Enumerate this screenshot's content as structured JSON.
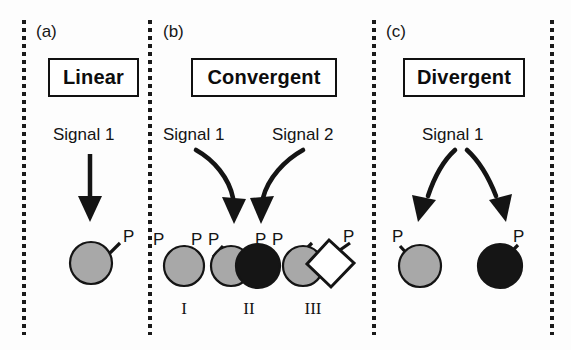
{
  "figure": {
    "background_color": "#fdfdfd",
    "ink_color": "#141414",
    "gray_fill": "#a8a8a8",
    "black_fill": "#151515",
    "white_fill": "#ffffff"
  },
  "panels": [
    {
      "letter": "(a)",
      "title": "Linear",
      "signals": [
        "Signal 1"
      ],
      "arrow_type": "straight",
      "groups": [],
      "molecules": [
        {
          "shape": "circle",
          "fill": "gray",
          "phosphates": [
            "P"
          ]
        }
      ]
    },
    {
      "letter": "(b)",
      "title": "Convergent",
      "signals": [
        "Signal 1",
        "Signal 2"
      ],
      "arrow_type": "curved-convergent",
      "groups": [
        "I",
        "II",
        "III"
      ],
      "molecules": [
        {
          "shape": "circle",
          "fill": "gray",
          "phosphates": [
            "P"
          ]
        },
        {
          "shape": "circle-pair",
          "fill": "gray+black",
          "phosphates": [
            "P",
            "P"
          ]
        },
        {
          "shape": "circle-diamond",
          "fill": "gray+white",
          "phosphates": [
            "P",
            "P",
            "P"
          ]
        }
      ]
    },
    {
      "letter": "(c)",
      "title": "Divergent",
      "signals": [
        "Signal 1"
      ],
      "arrow_type": "curved-divergent",
      "groups": [],
      "molecules": [
        {
          "shape": "circle",
          "fill": "gray",
          "phosphates": [
            "P"
          ]
        },
        {
          "shape": "circle",
          "fill": "black",
          "phosphates": [
            "P"
          ]
        }
      ]
    }
  ],
  "labels": {
    "panel_a_letter": "(a)",
    "panel_b_letter": "(b)",
    "panel_c_letter": "(c)",
    "title_a": "Linear",
    "title_b": "Convergent",
    "title_c": "Divergent",
    "signal_a1": "Signal 1",
    "signal_b1": "Signal 1",
    "signal_b2": "Signal 2",
    "signal_c1": "Signal 1",
    "p_a1": "P",
    "p_b1": "P",
    "p_b2": "P",
    "p_b3": "P",
    "p_b4": "P",
    "p_b5": "P",
    "p_b6": "P",
    "roman_i": "I",
    "roman_ii": "II",
    "roman_iii": "III",
    "p_c1": "P",
    "p_c2": "P"
  }
}
